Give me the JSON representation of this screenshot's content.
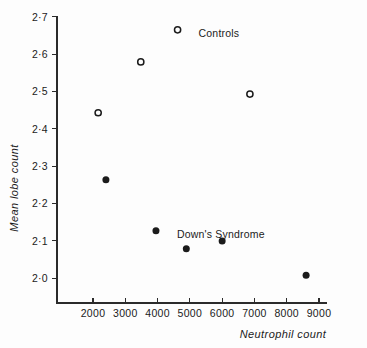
{
  "chart_data": {
    "type": "scatter",
    "title": "",
    "xlabel": "Neutrophil count",
    "ylabel": "Mean lobe count",
    "xlim": [
      1500,
      9300
    ],
    "ylim": [
      1.96,
      2.72
    ],
    "grid": false,
    "legend_position": "in-plot annotations",
    "x_ticks": [
      2000,
      3000,
      4000,
      5000,
      6000,
      7000,
      8000,
      9000
    ],
    "x_tick_labels": [
      "2000",
      "3000",
      "4000",
      "5000",
      "6000",
      "7000",
      "8000",
      "9000"
    ],
    "y_ticks": [
      2.0,
      2.1,
      2.2,
      2.3,
      2.4,
      2.5,
      2.6,
      2.7
    ],
    "y_tick_labels": [
      "2·0",
      "2·1",
      "2·2",
      "2·3",
      "2·4",
      "2·5",
      "2·6",
      "2·7"
    ],
    "series": [
      {
        "name": "Controls",
        "marker": "open-circle",
        "color": "#1b1b1b",
        "label_x": 5900,
        "label_y": 2.645,
        "points": [
          {
            "x": 2160,
            "y": 2.443
          },
          {
            "x": 3480,
            "y": 2.579
          },
          {
            "x": 4620,
            "y": 2.665
          },
          {
            "x": 6860,
            "y": 2.493
          }
        ]
      },
      {
        "name": "Down's Syndrome",
        "marker": "filled-circle",
        "color": "#1b1b1b",
        "label_x": 5960,
        "label_y": 2.108,
        "points": [
          {
            "x": 2400,
            "y": 2.264
          },
          {
            "x": 3950,
            "y": 2.127
          },
          {
            "x": 4890,
            "y": 2.079
          },
          {
            "x": 6000,
            "y": 2.1
          },
          {
            "x": 8600,
            "y": 2.008
          }
        ]
      }
    ]
  }
}
